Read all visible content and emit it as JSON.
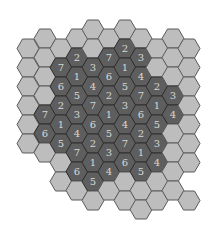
{
  "puzzle": {
    "type": "hexagonal number placement puzzle",
    "colors": {
      "outer_fill": "#bdbdbd",
      "outer_stroke": "#5a5a5a",
      "inner_fill": "#5e5e5e",
      "inner_stroke": "#2e2e2e",
      "number_color": "#d8d8d8"
    },
    "hex": {
      "width": 22,
      "height": 19
    },
    "cells": [
      {
        "x": 28,
        "y": 48,
        "kind": "outer",
        "value": ""
      },
      {
        "x": 28,
        "y": 67,
        "kind": "outer",
        "value": ""
      },
      {
        "x": 28,
        "y": 86,
        "kind": "outer",
        "value": ""
      },
      {
        "x": 28,
        "y": 105,
        "kind": "outer",
        "value": ""
      },
      {
        "x": 28,
        "y": 124,
        "kind": "outer",
        "value": ""
      },
      {
        "x": 28,
        "y": 143,
        "kind": "outer",
        "value": ""
      },
      {
        "x": 45,
        "y": 38,
        "kind": "outer",
        "value": ""
      },
      {
        "x": 45,
        "y": 57,
        "kind": "outer",
        "value": ""
      },
      {
        "x": 45,
        "y": 76,
        "kind": "outer",
        "value": ""
      },
      {
        "x": 45,
        "y": 95,
        "kind": "outer",
        "value": ""
      },
      {
        "x": 45,
        "y": 114,
        "kind": "inner",
        "value": "7"
      },
      {
        "x": 45,
        "y": 133,
        "kind": "inner",
        "value": "6"
      },
      {
        "x": 45,
        "y": 152,
        "kind": "outer",
        "value": ""
      },
      {
        "x": 61,
        "y": 48,
        "kind": "outer",
        "value": ""
      },
      {
        "x": 61,
        "y": 67,
        "kind": "inner",
        "value": "7"
      },
      {
        "x": 61,
        "y": 86,
        "kind": "inner",
        "value": "6"
      },
      {
        "x": 61,
        "y": 105,
        "kind": "inner",
        "value": "2"
      },
      {
        "x": 61,
        "y": 124,
        "kind": "inner",
        "value": "1"
      },
      {
        "x": 61,
        "y": 143,
        "kind": "inner",
        "value": "5"
      },
      {
        "x": 61,
        "y": 162,
        "kind": "outer",
        "value": ""
      },
      {
        "x": 61,
        "y": 181,
        "kind": "outer",
        "value": ""
      },
      {
        "x": 77,
        "y": 38,
        "kind": "outer",
        "value": ""
      },
      {
        "x": 77,
        "y": 57,
        "kind": "inner",
        "value": "2"
      },
      {
        "x": 77,
        "y": 76,
        "kind": "inner",
        "value": "1"
      },
      {
        "x": 77,
        "y": 95,
        "kind": "inner",
        "value": "5"
      },
      {
        "x": 77,
        "y": 114,
        "kind": "inner",
        "value": "3"
      },
      {
        "x": 77,
        "y": 133,
        "kind": "inner",
        "value": "4"
      },
      {
        "x": 77,
        "y": 152,
        "kind": "inner",
        "value": "7"
      },
      {
        "x": 77,
        "y": 171,
        "kind": "inner",
        "value": "6"
      },
      {
        "x": 77,
        "y": 190,
        "kind": "outer",
        "value": ""
      },
      {
        "x": 93,
        "y": 29,
        "kind": "outer",
        "value": ""
      },
      {
        "x": 93,
        "y": 48,
        "kind": "outer",
        "value": ""
      },
      {
        "x": 93,
        "y": 67,
        "kind": "inner",
        "value": "3"
      },
      {
        "x": 93,
        "y": 86,
        "kind": "inner",
        "value": "4"
      },
      {
        "x": 93,
        "y": 105,
        "kind": "inner",
        "value": "7"
      },
      {
        "x": 93,
        "y": 124,
        "kind": "inner",
        "value": "6"
      },
      {
        "x": 93,
        "y": 143,
        "kind": "inner",
        "value": "2"
      },
      {
        "x": 93,
        "y": 162,
        "kind": "inner",
        "value": "1"
      },
      {
        "x": 93,
        "y": 181,
        "kind": "inner",
        "value": "5"
      },
      {
        "x": 93,
        "y": 200,
        "kind": "outer",
        "value": ""
      },
      {
        "x": 109,
        "y": 38,
        "kind": "outer",
        "value": ""
      },
      {
        "x": 109,
        "y": 57,
        "kind": "inner",
        "value": "7"
      },
      {
        "x": 109,
        "y": 76,
        "kind": "inner",
        "value": "6"
      },
      {
        "x": 109,
        "y": 95,
        "kind": "inner",
        "value": "2"
      },
      {
        "x": 109,
        "y": 114,
        "kind": "inner",
        "value": "1"
      },
      {
        "x": 109,
        "y": 133,
        "kind": "inner",
        "value": "5"
      },
      {
        "x": 109,
        "y": 152,
        "kind": "inner",
        "value": "3"
      },
      {
        "x": 109,
        "y": 171,
        "kind": "inner",
        "value": "4"
      },
      {
        "x": 109,
        "y": 190,
        "kind": "outer",
        "value": ""
      },
      {
        "x": 125,
        "y": 29,
        "kind": "outer",
        "value": ""
      },
      {
        "x": 125,
        "y": 48,
        "kind": "inner",
        "value": "2"
      },
      {
        "x": 125,
        "y": 67,
        "kind": "inner",
        "value": "1"
      },
      {
        "x": 125,
        "y": 86,
        "kind": "inner",
        "value": "5"
      },
      {
        "x": 125,
        "y": 105,
        "kind": "inner",
        "value": "3"
      },
      {
        "x": 125,
        "y": 124,
        "kind": "inner",
        "value": "4"
      },
      {
        "x": 125,
        "y": 143,
        "kind": "inner",
        "value": "7"
      },
      {
        "x": 125,
        "y": 162,
        "kind": "inner",
        "value": "6"
      },
      {
        "x": 125,
        "y": 181,
        "kind": "outer",
        "value": ""
      },
      {
        "x": 125,
        "y": 200,
        "kind": "outer",
        "value": ""
      },
      {
        "x": 141,
        "y": 38,
        "kind": "outer",
        "value": ""
      },
      {
        "x": 141,
        "y": 57,
        "kind": "inner",
        "value": "3"
      },
      {
        "x": 141,
        "y": 76,
        "kind": "inner",
        "value": "4"
      },
      {
        "x": 141,
        "y": 95,
        "kind": "inner",
        "value": "7"
      },
      {
        "x": 141,
        "y": 114,
        "kind": "inner",
        "value": "6"
      },
      {
        "x": 141,
        "y": 133,
        "kind": "inner",
        "value": "2"
      },
      {
        "x": 141,
        "y": 152,
        "kind": "inner",
        "value": "1"
      },
      {
        "x": 141,
        "y": 171,
        "kind": "inner",
        "value": "5"
      },
      {
        "x": 141,
        "y": 190,
        "kind": "outer",
        "value": ""
      },
      {
        "x": 141,
        "y": 209,
        "kind": "outer",
        "value": ""
      },
      {
        "x": 157,
        "y": 48,
        "kind": "outer",
        "value": ""
      },
      {
        "x": 157,
        "y": 67,
        "kind": "outer",
        "value": ""
      },
      {
        "x": 157,
        "y": 86,
        "kind": "inner",
        "value": "2"
      },
      {
        "x": 157,
        "y": 105,
        "kind": "inner",
        "value": "1"
      },
      {
        "x": 157,
        "y": 124,
        "kind": "inner",
        "value": "5"
      },
      {
        "x": 157,
        "y": 143,
        "kind": "inner",
        "value": "3"
      },
      {
        "x": 157,
        "y": 162,
        "kind": "inner",
        "value": "4"
      },
      {
        "x": 157,
        "y": 181,
        "kind": "outer",
        "value": ""
      },
      {
        "x": 157,
        "y": 200,
        "kind": "outer",
        "value": ""
      },
      {
        "x": 173,
        "y": 38,
        "kind": "outer",
        "value": ""
      },
      {
        "x": 173,
        "y": 57,
        "kind": "outer",
        "value": ""
      },
      {
        "x": 173,
        "y": 76,
        "kind": "outer",
        "value": ""
      },
      {
        "x": 173,
        "y": 95,
        "kind": "inner",
        "value": "3"
      },
      {
        "x": 173,
        "y": 114,
        "kind": "inner",
        "value": "4"
      },
      {
        "x": 173,
        "y": 133,
        "kind": "outer",
        "value": ""
      },
      {
        "x": 173,
        "y": 152,
        "kind": "outer",
        "value": ""
      },
      {
        "x": 173,
        "y": 171,
        "kind": "outer",
        "value": ""
      },
      {
        "x": 173,
        "y": 190,
        "kind": "outer",
        "value": ""
      },
      {
        "x": 189,
        "y": 48,
        "kind": "outer",
        "value": ""
      },
      {
        "x": 189,
        "y": 67,
        "kind": "outer",
        "value": ""
      },
      {
        "x": 189,
        "y": 86,
        "kind": "outer",
        "value": ""
      },
      {
        "x": 189,
        "y": 105,
        "kind": "outer",
        "value": ""
      },
      {
        "x": 189,
        "y": 124,
        "kind": "outer",
        "value": ""
      },
      {
        "x": 189,
        "y": 143,
        "kind": "outer",
        "value": ""
      },
      {
        "x": 189,
        "y": 162,
        "kind": "outer",
        "value": ""
      },
      {
        "x": 189,
        "y": 200,
        "kind": "outer",
        "value": ""
      }
    ]
  }
}
